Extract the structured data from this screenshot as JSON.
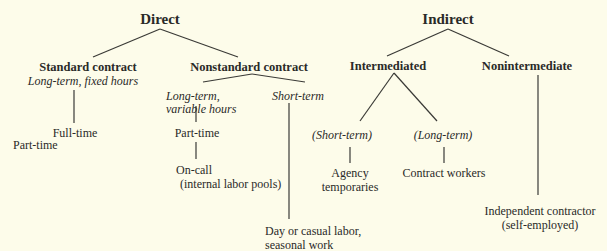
{
  "diagram": {
    "root_left": {
      "label": "Direct"
    },
    "root_right": {
      "label": "Indirect"
    },
    "direct": {
      "standard": {
        "label": "Standard contract",
        "sublabel": "Long-term, fixed hours",
        "children": [
          "Full-time",
          "Part-time"
        ]
      },
      "nonstandard": {
        "label": "Nonstandard contract",
        "long_term": {
          "label_line1": "Long-term,",
          "label_line2": "variable hours",
          "child": "Part-time",
          "grandchild_line1": "On-call",
          "grandchild_line2": "(internal labor pools)"
        },
        "short_term": {
          "label": "Short-term",
          "child_line1": "Day or casual labor,",
          "child_line2": "seasonal work"
        }
      }
    },
    "indirect": {
      "intermediated": {
        "label": "Intermediated",
        "short_term": {
          "label": "(Short-term)",
          "child_line1": "Agency",
          "child_line2": "temporaries"
        },
        "long_term": {
          "label": "(Long-term)",
          "child": "Contract workers"
        }
      },
      "nonintermediate": {
        "label": "Nonintermediate",
        "child_line1": "Independent contractor",
        "child_line2": "(self-employed)"
      }
    }
  }
}
